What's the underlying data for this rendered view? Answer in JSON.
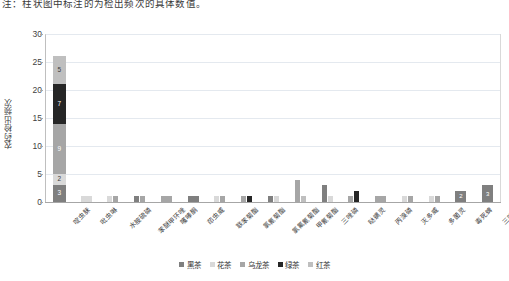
{
  "caption": "注：柱状图中标注的为检出频次的具体数值。",
  "chart_data": {
    "type": "bar",
    "subtype": "stacked-bar",
    "title": "",
    "xlabel": "",
    "ylabel": "农药检出频次",
    "ylim": [
      0,
      30
    ],
    "yticks": [
      0,
      5,
      10,
      15,
      20,
      25,
      30
    ],
    "grid": true,
    "legend_position": "bottom",
    "series": [
      {
        "name": "黑茶",
        "color": "#7f7f7f",
        "values": [
          3,
          0,
          0,
          1,
          0,
          1,
          0,
          0,
          1,
          0,
          3,
          0,
          0,
          0,
          0,
          2,
          3
        ]
      },
      {
        "name": "花茶",
        "color": "#d9d9d9",
        "values": [
          2,
          1,
          1,
          0,
          0,
          0,
          1,
          0,
          1,
          0,
          1,
          0,
          0,
          1,
          1,
          0,
          0
        ]
      },
      {
        "name": "乌龙茶",
        "color": "#a6a6a6",
        "values": [
          9,
          0,
          1,
          1,
          1,
          0,
          1,
          1,
          0,
          4,
          0,
          1,
          1,
          1,
          1,
          0,
          0
        ]
      },
      {
        "name": "绿茶",
        "color": "#262626",
        "values": [
          7,
          0,
          0,
          0,
          0,
          0,
          0,
          1,
          0,
          0,
          0,
          2,
          0,
          0,
          0,
          0,
          0
        ]
      },
      {
        "name": "红茶",
        "color": "#bfbfbf",
        "values": [
          5,
          0,
          0,
          0,
          0,
          0,
          0,
          0,
          0,
          1,
          0,
          0,
          0,
          0,
          0,
          0,
          0
        ]
      }
    ],
    "categories": [
      "啶虫脒",
      "吡虫啉",
      "水胺硫磷",
      "苯醚甲环唑",
      "噻嗪酮",
      "茚虫威",
      "联苯菊酯",
      "氯氰菊酯",
      "氯氟氰菊酯",
      "甲氰菊酯",
      "三唑磷",
      "哒螨灵",
      "丙溴磷",
      "灭多威",
      "多菌灵",
      "毒死蜱",
      "三唑酮"
    ],
    "totals": [
      26,
      1,
      2,
      2,
      1,
      1,
      2,
      2,
      2,
      5,
      4,
      3,
      1,
      2,
      2,
      2,
      3
    ],
    "stacked_bar_index": 0,
    "stacked_bar_labels": [
      3,
      2,
      9,
      7,
      5
    ]
  }
}
